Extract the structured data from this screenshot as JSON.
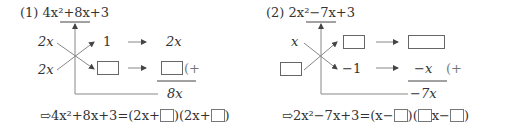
{
  "problems": [
    {
      "number": "(1)",
      "expression_parts": [
        "4",
        "x",
        "2",
        "+8",
        "x",
        "+3"
      ],
      "expression": "4x²+8x+3",
      "underlined_term": "+8x",
      "cross": {
        "left_top": "2x",
        "left_bottom": "2x",
        "right_top": "1",
        "right_bottom": "□",
        "result_top": "2x",
        "result_bottom": "□",
        "plus_mark": "(+",
        "sum": "8x"
      },
      "result_line": {
        "arrow": "⇨",
        "lhs": "4x²+8x+3",
        "equals": "=",
        "factor1_prefix": "(2x+",
        "factor1_suffix": ")",
        "factor2_prefix": "(2x+",
        "factor2_suffix": ")"
      }
    },
    {
      "number": "(2)",
      "expression": "2x²−7x+3",
      "underlined_term": "−7x",
      "cross": {
        "left_top": "x",
        "left_bottom": "□",
        "right_top": "□",
        "right_bottom": "−1",
        "result_top": "□",
        "result_bottom": "−x",
        "plus_mark": "(+",
        "sum": "−7x"
      },
      "result_line": {
        "arrow": "⇨",
        "lhs": "2x²−7x+3",
        "equals": "=",
        "factor1_prefix": "(x−",
        "factor1_suffix": ")",
        "factor2_prefix": "(",
        "factor2_mid": "x−",
        "factor2_suffix": ")"
      }
    }
  ],
  "colors": {
    "text": "#333333",
    "line": "#888888",
    "box_border": "#666666"
  }
}
